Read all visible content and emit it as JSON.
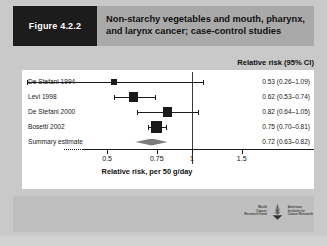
{
  "figure": {
    "tag": "Figure 4.2.2",
    "title": "Non-starchy vegetables and mouth, pharynx, and larynx cancer; case-control studies"
  },
  "columns": {
    "risk_header": "Relative risk (95% CI)"
  },
  "axis": {
    "caption": "Relative risk, per 50 g/day",
    "ticks": [
      "0.5",
      "0.75",
      "1",
      "1.5"
    ]
  },
  "logos": {
    "left": "World Cancer Research Fund",
    "left_lines": [
      "World",
      "Cancer",
      "Research Fund"
    ],
    "right": "American Institute for Cancer Research",
    "right_lines": [
      "American",
      "Institute for",
      "Cancer Research"
    ]
  },
  "chart_data": {
    "type": "forest",
    "title": "Non-starchy vegetables and mouth, pharynx, and larynx cancer; case-control studies",
    "xlabel": "Relative risk, per 50 g/day",
    "ylabel": "",
    "xscale": "log",
    "xlim": [
      0.42,
      1.75
    ],
    "xticks": [
      0.5,
      0.75,
      1,
      1.5
    ],
    "null_value": 1,
    "grid": false,
    "legend": "none",
    "value_column_header": "Relative risk (95% CI)",
    "rows": [
      {
        "study": "De Stefani 1994",
        "estimate": 0.53,
        "ci_low": 0.26,
        "ci_high": 1.09,
        "label": "0.53 (0.26–1.09)",
        "weight": 0.08,
        "marker": "square"
      },
      {
        "study": "Levi 1998",
        "estimate": 0.62,
        "ci_low": 0.53,
        "ci_high": 0.74,
        "label": "0.62 (0.53–0.74)",
        "weight": 0.3,
        "marker": "square"
      },
      {
        "study": "De Stefani 2000",
        "estimate": 0.82,
        "ci_low": 0.64,
        "ci_high": 1.05,
        "label": "0.82 (0.64–1.05)",
        "weight": 0.26,
        "marker": "square"
      },
      {
        "study": "Bosetti 2002",
        "estimate": 0.75,
        "ci_low": 0.7,
        "ci_high": 0.81,
        "label": "0.75 (0.70–0.81)",
        "weight": 0.46,
        "marker": "square"
      },
      {
        "study": "Summary estimate",
        "estimate": 0.72,
        "ci_low": 0.63,
        "ci_high": 0.82,
        "label": "0.72 (0.63–0.82)",
        "weight": 1.0,
        "marker": "diamond"
      }
    ]
  }
}
